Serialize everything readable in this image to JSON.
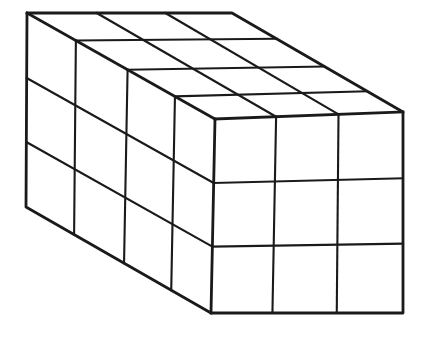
{
  "figure": {
    "type": "cuboid-grid-diagram",
    "dimensions": {
      "width_cubes": 3,
      "height_cubes": 3,
      "depth_cubes": 4,
      "total_cubes": 36
    },
    "visible_faces": [
      "top",
      "left",
      "front"
    ],
    "style": {
      "background": "#ffffff",
      "stroke": "#1a1a1a",
      "outline_width": 2.8,
      "grid_width": 2.1
    },
    "canvas": {
      "width": 425,
      "height": 346
    },
    "corners": {
      "back_top_left": [
        27,
        13
      ],
      "back_top_right": [
        232,
        13
      ],
      "front_top_right": [
        403,
        112
      ],
      "front_top_left": [
        215,
        119
      ],
      "front_bottom_left": [
        211,
        313
      ],
      "front_bottom_right": [
        403,
        313
      ],
      "back_bottom_left": [
        26,
        207
      ]
    },
    "silhouette": [
      "back_top_left",
      "back_top_right",
      "front_top_right",
      "front_bottom_right",
      "front_bottom_left",
      "back_bottom_left"
    ],
    "internal_edges": [
      [
        "back_top_left",
        "front_top_left"
      ],
      [
        "front_top_left",
        "front_top_right"
      ],
      [
        "front_top_left",
        "front_bottom_left"
      ]
    ],
    "faces": [
      {
        "name": "top",
        "quad": [
          "back_top_left",
          "back_top_right",
          "front_top_right",
          "front_top_left"
        ],
        "u_lines": [
          {
            "a": 0.34,
            "b": 0.325
          },
          {
            "a": 0.675,
            "b": 0.657
          }
        ],
        "v_lines": [
          {
            "a": 0.26,
            "b": 0.26
          },
          {
            "a": 0.535,
            "b": 0.54
          },
          {
            "a": 0.787,
            "b": 0.79
          }
        ]
      },
      {
        "name": "left",
        "quad": [
          "back_top_left",
          "front_top_left",
          "front_bottom_left",
          "back_bottom_left"
        ],
        "u_lines": [
          {
            "a": 0.26,
            "b": 0.26
          },
          {
            "a": 0.535,
            "b": 0.53
          },
          {
            "a": 0.787,
            "b": 0.785
          }
        ],
        "v_lines": [
          {
            "a": 0.335,
            "b": 0.33
          },
          {
            "a": 0.665,
            "b": 0.658
          }
        ]
      },
      {
        "name": "front",
        "quad": [
          "front_top_left",
          "front_top_right",
          "front_bottom_right",
          "front_bottom_left"
        ],
        "u_lines": [
          {
            "a": 0.325,
            "b": 0.32
          },
          {
            "a": 0.657,
            "b": 0.655
          }
        ],
        "v_lines": [
          {
            "a": 0.33,
            "b": 0.33
          },
          {
            "a": 0.658,
            "b": 0.655
          }
        ]
      }
    ]
  }
}
